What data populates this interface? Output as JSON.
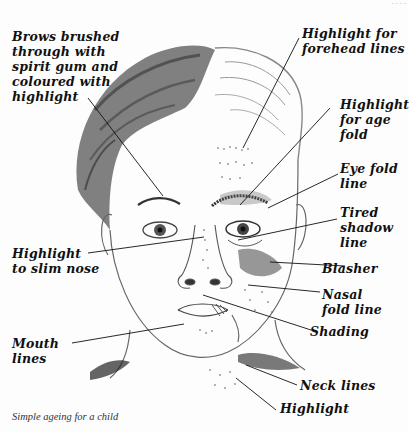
{
  "page": {
    "running_head": "· · · ·",
    "caption": "Simple ageing for a child"
  },
  "illustration": {
    "subject": "pencil drawing of a child's face, right half aged with makeup",
    "colors": {
      "ink": "#111111",
      "pencil": "#555555",
      "shade_dark": "#2a2a2a",
      "paper": "#fdfdfd"
    }
  },
  "labels": [
    {
      "id": "brows",
      "text": "Brows brushed\nthrough with\nspirit gum and\ncoloured with\nhighlight"
    },
    {
      "id": "forehead",
      "text": "Highlight for\nforehead lines"
    },
    {
      "id": "age-fold",
      "text": "Highlight\nfor age\nfold"
    },
    {
      "id": "eye-fold",
      "text": "Eye fold\nline"
    },
    {
      "id": "tired-shadow",
      "text": "Tired\nshadow\nline"
    },
    {
      "id": "nose",
      "text": "Highlight\nto slim nose"
    },
    {
      "id": "blasher",
      "text": "Blasher"
    },
    {
      "id": "nasal-fold",
      "text": "Nasal\nfold line"
    },
    {
      "id": "shading",
      "text": "Shading"
    },
    {
      "id": "mouth",
      "text": "Mouth\nlines"
    },
    {
      "id": "neck",
      "text": "Neck lines"
    },
    {
      "id": "neck-highlight",
      "text": "Highlight"
    }
  ]
}
